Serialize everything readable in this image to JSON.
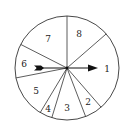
{
  "spinner": {
    "center": [
      67,
      68
    ],
    "radius": 52,
    "boundary_angles_deg": [
      90,
      41,
      -49,
      -69,
      -107,
      -121,
      -169,
      153
    ],
    "sectors": [
      {
        "label": "1",
        "label_pos": [
          107,
          69
        ]
      },
      {
        "label": "2",
        "label_pos": [
          88,
          102
        ]
      },
      {
        "label": "3",
        "label_pos": [
          67,
          108
        ]
      },
      {
        "label": "4",
        "label_pos": [
          48,
          109
        ]
      },
      {
        "label": "5",
        "label_pos": [
          36,
          91
        ]
      },
      {
        "label": "6",
        "label_pos": [
          24,
          64
        ]
      },
      {
        "label": "7",
        "label_pos": [
          48,
          39
        ]
      },
      {
        "label": "8",
        "label_pos": [
          79,
          34
        ]
      }
    ],
    "arrow": {
      "from": [
        35,
        68
      ],
      "to": [
        97,
        68
      ],
      "color": "#111111"
    }
  }
}
